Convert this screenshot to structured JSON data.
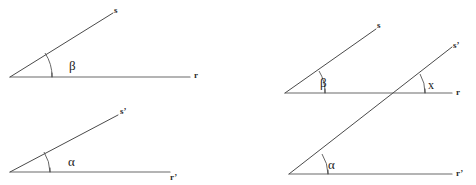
{
  "figure": {
    "background_color": "#ffffff",
    "line_color": "#4a4a4a",
    "baseline_color": "#6b6b6b",
    "arc_color": "#555555",
    "text_color": "#1a1a1a",
    "width": 476,
    "height": 185
  },
  "panels": [
    {
      "id": "left-top",
      "name": "isolated-angle-beta",
      "angle_label": "β",
      "rays": [
        {
          "name": "ray-s",
          "label": "s"
        },
        {
          "name": "ray-r",
          "label": "r"
        }
      ]
    },
    {
      "id": "left-bottom",
      "name": "isolated-angle-alpha",
      "angle_label": "α",
      "rays": [
        {
          "name": "ray-s-prime",
          "label": "s’"
        },
        {
          "name": "ray-r-prime",
          "label": "r’"
        }
      ]
    },
    {
      "id": "right",
      "name": "transversal-construction",
      "angles": [
        {
          "name": "angle-beta",
          "label": "β"
        },
        {
          "name": "angle-alpha",
          "label": "α"
        },
        {
          "name": "angle-x",
          "label": "x"
        }
      ],
      "rays": [
        {
          "name": "ray-s",
          "label": "s"
        },
        {
          "name": "ray-s-prime",
          "label": "s’"
        },
        {
          "name": "ray-r",
          "label": "r"
        },
        {
          "name": "ray-r-prime",
          "label": "r’"
        }
      ]
    }
  ],
  "labels": {
    "left_top_s": "s",
    "left_top_r": "r",
    "left_top_beta": "β",
    "left_bottom_s_prime": "s’",
    "left_bottom_r_prime": "r’",
    "left_bottom_alpha": "α",
    "right_s": "s",
    "right_s_prime": "s’",
    "right_r": "r",
    "right_r_prime": "r’",
    "right_beta": "β",
    "right_alpha": "α",
    "right_x": "x"
  }
}
